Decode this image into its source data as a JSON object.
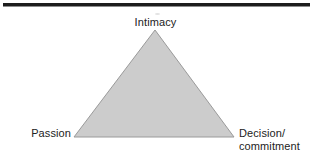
{
  "figure": {
    "type": "triangle-diagram",
    "background_color": "#ffffff",
    "rule": {
      "name": "top-horizontal-rule",
      "color": "#1d1d1d"
    },
    "triangle": {
      "fill_color": "#cccccc",
      "stroke_color": "#9a9a9a",
      "vertices": {
        "apex": {
          "x": 155,
          "y": 30
        },
        "bottom_left": {
          "x": 74,
          "y": 137
        },
        "bottom_right": {
          "x": 234,
          "y": 137
        }
      }
    },
    "labels": {
      "apex": "Intimacy",
      "bottom_left": "Passion",
      "bottom_right_line1": "Decision/",
      "bottom_right_line2": "commitment"
    }
  }
}
